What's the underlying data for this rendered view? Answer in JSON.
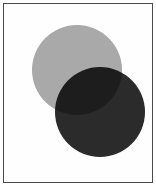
{
  "figure": {
    "width": 156,
    "height": 186,
    "background_color": "#ffffff",
    "caption": ""
  },
  "frame": {
    "name": "image-border",
    "inset_px": 3,
    "border_width_px": 1,
    "border_color": "#4a4a4a",
    "fill_color": "#fefefe"
  },
  "shapes": [
    {
      "name": "light-gray-circle",
      "type": "circle",
      "label": "Light gray circle",
      "fill_color": "#a9a9a9",
      "center_x": 77,
      "center_y": 70,
      "diameter": 90,
      "radius": 45,
      "z_order": 1,
      "blend_mode": "multiply"
    },
    {
      "name": "dark-circle",
      "type": "circle",
      "label": "Dark near-black circle",
      "fill_color": "#2b2b2b",
      "center_x": 100,
      "center_y": 112,
      "diameter": 90,
      "radius": 45,
      "z_order": 2,
      "blend_mode": "multiply"
    }
  ],
  "intersection": {
    "name": "lens-overlap-region",
    "label": "Overlap lens",
    "rendered_color": "#050505",
    "shape": "lens"
  },
  "colors": {
    "page_background": "#ffffff",
    "frame_fill": "#fefefe",
    "frame_stroke": "#4a4a4a",
    "light_gray": "#a9a9a9",
    "dark_gray": "#2b2b2b",
    "overlap_black": "#050505"
  }
}
